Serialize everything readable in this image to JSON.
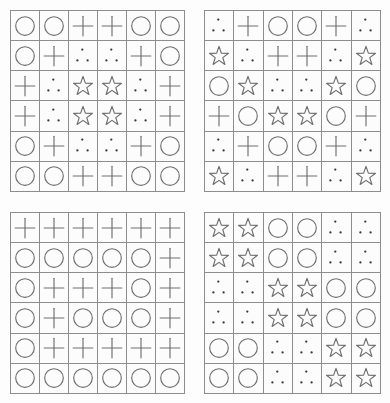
{
  "page": {
    "background_color": "#fdfdfd",
    "grid_line_color": "#8d8d8d",
    "symbol_color": "#6e6e6e",
    "dot_color": "#3a3a3a",
    "grid_count": 4,
    "rows": 6,
    "columns": 6,
    "symbol_legend": [
      {
        "key": "circle",
        "name": "circle-icon",
        "label": "circle"
      },
      {
        "key": "plus",
        "name": "plus-icon",
        "label": "plus"
      },
      {
        "key": "star",
        "name": "star-icon",
        "label": "star"
      },
      {
        "key": "dots",
        "name": "three-dots-icon",
        "label": "three dots"
      }
    ]
  },
  "grids": [
    {
      "name": "grid-top-left",
      "position": "top-left",
      "cells": [
        [
          "circle",
          "circle",
          "plus",
          "plus",
          "circle",
          "circle"
        ],
        [
          "circle",
          "plus",
          "dots",
          "dots",
          "plus",
          "circle"
        ],
        [
          "plus",
          "dots",
          "star",
          "star",
          "dots",
          "plus"
        ],
        [
          "plus",
          "dots",
          "star",
          "star",
          "dots",
          "plus"
        ],
        [
          "circle",
          "plus",
          "dots",
          "dots",
          "plus",
          "circle"
        ],
        [
          "circle",
          "circle",
          "plus",
          "plus",
          "circle",
          "circle"
        ]
      ]
    },
    {
      "name": "grid-top-right",
      "position": "top-right",
      "cells": [
        [
          "dots",
          "plus",
          "circle",
          "circle",
          "plus",
          "dots"
        ],
        [
          "star",
          "dots",
          "plus",
          "plus",
          "dots",
          "star"
        ],
        [
          "circle",
          "star",
          "dots",
          "dots",
          "star",
          "circle"
        ],
        [
          "plus",
          "circle",
          "star",
          "star",
          "circle",
          "plus"
        ],
        [
          "dots",
          "plus",
          "circle",
          "circle",
          "plus",
          "dots"
        ],
        [
          "star",
          "dots",
          "plus",
          "plus",
          "dots",
          "star"
        ]
      ]
    },
    {
      "name": "grid-bottom-left",
      "position": "bottom-left",
      "cells": [
        [
          "plus",
          "plus",
          "plus",
          "plus",
          "plus",
          "plus"
        ],
        [
          "circle",
          "circle",
          "circle",
          "circle",
          "circle",
          "plus"
        ],
        [
          "circle",
          "plus",
          "plus",
          "plus",
          "circle",
          "plus"
        ],
        [
          "circle",
          "plus",
          "circle",
          "circle",
          "circle",
          "plus"
        ],
        [
          "circle",
          "plus",
          "plus",
          "plus",
          "plus",
          "plus"
        ],
        [
          "circle",
          "circle",
          "circle",
          "circle",
          "circle",
          "circle"
        ]
      ]
    },
    {
      "name": "grid-bottom-right",
      "position": "bottom-right",
      "cells": [
        [
          "star",
          "star",
          "circle",
          "circle",
          "dots",
          "dots"
        ],
        [
          "star",
          "star",
          "circle",
          "circle",
          "dots",
          "dots"
        ],
        [
          "dots",
          "dots",
          "star",
          "star",
          "circle",
          "circle"
        ],
        [
          "dots",
          "dots",
          "star",
          "star",
          "circle",
          "circle"
        ],
        [
          "circle",
          "circle",
          "dots",
          "dots",
          "star",
          "star"
        ],
        [
          "circle",
          "circle",
          "dots",
          "dots",
          "star",
          "star"
        ]
      ]
    }
  ]
}
